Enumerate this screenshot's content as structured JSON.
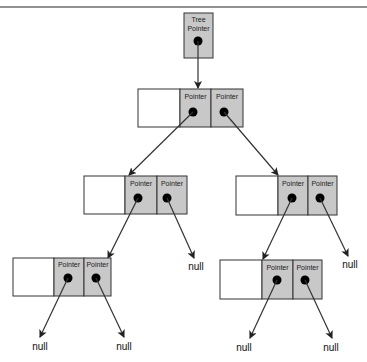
{
  "diagram": {
    "type": "binary-tree-pointer-structure",
    "colors": {
      "pointer_cell": "#c8c8c8",
      "data_cell": "#ffffff",
      "border": "#333333",
      "line": "#333333",
      "top_rule": "#6e6e6e"
    },
    "tree_pointer": {
      "label_line1": "Tree",
      "label_line2": "Pointer"
    },
    "pointer_label": "Pointer",
    "null_label": "null",
    "nodes": [
      {
        "id": "root",
        "left": "pointer",
        "right": "pointer"
      },
      {
        "id": "level2-left",
        "left": "pointer",
        "right": "null"
      },
      {
        "id": "level2-right",
        "left": "pointer",
        "right": "null"
      },
      {
        "id": "level3-left",
        "left": "null",
        "right": "null"
      },
      {
        "id": "level3-right",
        "left": "null",
        "right": "null"
      }
    ],
    "labels": {
      "root_left": "Pointer",
      "root_right": "Pointer",
      "l2l_left": "Pointer",
      "l2l_right": "Pointer",
      "l2r_left": "Pointer",
      "l2r_right": "Pointer",
      "l3l_left": "Pointer",
      "l3l_right": "Pointer",
      "l3r_left": "Pointer",
      "l3r_right": "Pointer",
      "null_1": "null",
      "null_2": "null",
      "null_3": "null",
      "null_4": "null",
      "null_5": "null",
      "null_6": "null"
    }
  }
}
